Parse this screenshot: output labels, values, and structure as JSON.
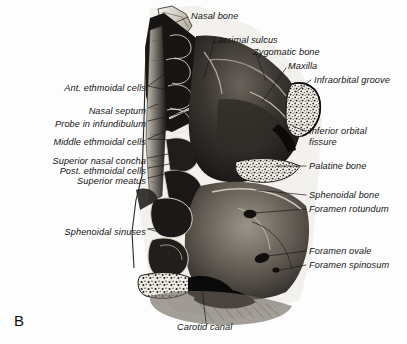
{
  "figure": {
    "panel_letter": "B",
    "background_color": "#fdfdfd",
    "ink_color": "#141414"
  },
  "labels": {
    "left": [
      {
        "text": "Ant. ethmoidal cells",
        "x": 146,
        "y": 88
      },
      {
        "text": "Nasal septum",
        "x": 146,
        "y": 111
      },
      {
        "text": "Probe in infundibulum",
        "x": 146,
        "y": 124
      },
      {
        "text": "Middle ethmoidal cells",
        "x": 146,
        "y": 142
      },
      {
        "text": "Superior nasal concha",
        "x": 146,
        "y": 161
      },
      {
        "text": "Post. ethmoidal cells",
        "x": 146,
        "y": 171
      },
      {
        "text": "Superior meatus",
        "x": 146,
        "y": 181
      },
      {
        "text": "Sphenoidal sinuses",
        "x": 146,
        "y": 232
      }
    ],
    "top": [
      {
        "text": "Nasal bone",
        "x": 191,
        "y": 13
      },
      {
        "text": "Lacrimal sulcus",
        "x": 212,
        "y": 38
      },
      {
        "text": "Zygomatic bone",
        "x": 253,
        "y": 50
      },
      {
        "text": "Maxilla",
        "x": 288,
        "y": 64
      }
    ],
    "right": [
      {
        "text": "Infraorbital groove",
        "x": 313,
        "y": 81
      },
      {
        "text": "Inferior orbital",
        "x": 308,
        "y": 131,
        "line2": "fissure"
      },
      {
        "text": "Palatine bone",
        "x": 308,
        "y": 168
      },
      {
        "text": "Sphenoidal bone",
        "x": 308,
        "y": 197
      },
      {
        "text": "Foramen rotundum",
        "x": 308,
        "y": 211
      },
      {
        "text": "Foramen ovale",
        "x": 308,
        "y": 253
      },
      {
        "text": "Foramen spinosum",
        "x": 308,
        "y": 267
      }
    ],
    "bottom": [
      {
        "text": "Carotid canal",
        "x": 176,
        "y": 327
      }
    ]
  },
  "leader_lines": {
    "stroke_color": "#1a1a1a",
    "stroke_width": 0.7,
    "count": 17
  }
}
